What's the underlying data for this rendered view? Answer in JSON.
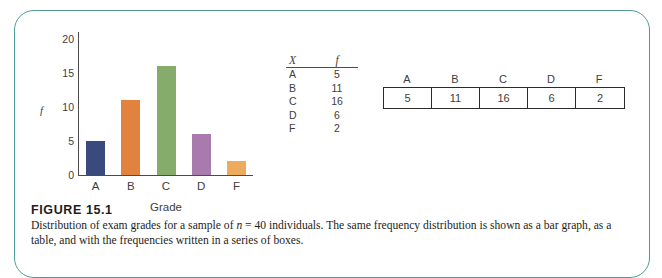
{
  "figure": {
    "number_label": "FIGURE 15.1",
    "caption_line1": "Distribution of exam grades for a sample of n = 40 individuals. The same frequency distribution is shown as a bar graph,",
    "caption_line2": "as a table, and with the frequencies written in a series of boxes.",
    "caption_italic_token": "n",
    "frame_color": "#4e9c94"
  },
  "chart_data": {
    "type": "bar",
    "title": "",
    "xlabel": "Grade",
    "ylabel": "f",
    "categories": [
      "A",
      "B",
      "C",
      "D",
      "F"
    ],
    "values": [
      5,
      11,
      16,
      6,
      2
    ],
    "ylim": [
      0,
      21
    ],
    "yticks": [
      "0",
      "5",
      "10",
      "15",
      "20"
    ],
    "ytick_values": [
      0,
      5,
      10,
      15,
      20
    ],
    "grid": false,
    "legend": "none",
    "colors": [
      "#3a4a7c",
      "#e2823f",
      "#86ac6c",
      "#a87aad",
      "#edab5e"
    ]
  },
  "table": {
    "header_x": "X",
    "header_f": "f",
    "rows": [
      {
        "x": "A",
        "f": "5"
      },
      {
        "x": "B",
        "f": "11"
      },
      {
        "x": "C",
        "f": "16"
      },
      {
        "x": "D",
        "f": "6"
      },
      {
        "x": "F",
        "f": "2"
      }
    ]
  },
  "boxrow": {
    "labels": [
      "A",
      "B",
      "C",
      "D",
      "F"
    ],
    "values": [
      "5",
      "11",
      "16",
      "6",
      "2"
    ]
  }
}
